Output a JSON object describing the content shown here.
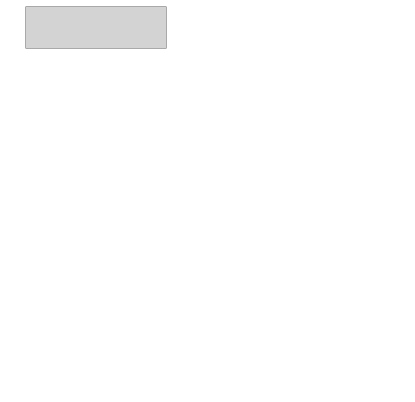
{
  "context_bar": {
    "fill": "#d3d3d3",
    "items": [
      {
        "line1": "情境",
        "line2": "信息1"
      },
      {
        "line1": "情境",
        "line2": "信息2"
      },
      {
        "line1": "情境",
        "line2": "信息3"
      },
      {
        "line1": "情境",
        "line2": "信息4"
      },
      {
        "line1": "情境",
        "line2": "信息5"
      },
      {
        "line1": "情境",
        "line2": "信息6"
      },
      {
        "line1": "情境",
        "line2": "信息7"
      }
    ]
  },
  "activity": {
    "label": "活动A",
    "fill": "#d3d3d3"
  },
  "behaviors": [
    {
      "label": "行为1",
      "highlighted": false
    },
    {
      "label": "行为2",
      "highlighted": true
    },
    {
      "label": "行为3",
      "highlighted": false
    },
    {
      "label": "行为4",
      "highlighted": true
    },
    {
      "label": "行为5",
      "highlighted": false
    }
  ],
  "operations": [
    {
      "label": "操作1",
      "highlighted": true
    },
    {
      "label": "操作2",
      "highlighted": false
    },
    {
      "label": "操作3",
      "highlighted": false
    },
    {
      "label": "操作4",
      "highlighted": false
    },
    {
      "label": "操作5",
      "highlighted": true
    }
  ],
  "inference": {
    "activity": {
      "title": "活动推理",
      "columns": [
        "活动开始",
        "活动进行",
        "活动中止",
        "活动结束"
      ]
    },
    "behavior": {
      "title": "行为推理",
      "columns": [
        "行为开始",
        "行为进行",
        "行为切换",
        "行为中止",
        "行为结束"
      ]
    },
    "operation": {
      "title": "操作推理",
      "columns": [
        "叠加语义位置",
        "叠加特殊场景",
        "叠加兴趣点",
        "叠加事件",
        "叠加时间距离"
      ]
    }
  },
  "colors": {
    "highlight": "#d3d3d3",
    "line": "#444444",
    "dashed": "#c8c8c8"
  }
}
